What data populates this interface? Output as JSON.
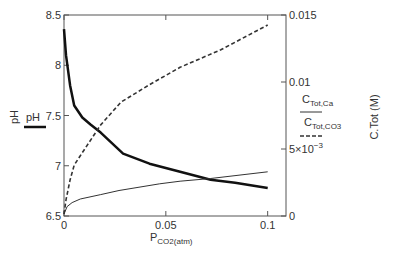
{
  "chart_data": {
    "type": "line",
    "title": "",
    "xlabel": "P",
    "xlabel_subscript": "CO2(atm)",
    "ylabel_left": "pH",
    "ylabel_right": "C.Tot (M)",
    "xlim": [
      0,
      0.109
    ],
    "ylim_left": [
      6.5,
      8.5
    ],
    "ylim_right": [
      0,
      0.015
    ],
    "grid": false,
    "x_ticks": [
      {
        "value": 0,
        "label": "0"
      },
      {
        "value": 0.05,
        "label": "0.05"
      },
      {
        "value": 0.1,
        "label": "0.1"
      }
    ],
    "y_ticks_left": [
      {
        "value": 6.5,
        "label": "6.5"
      },
      {
        "value": 7,
        "label": "7"
      },
      {
        "value": 7.5,
        "label": "7.5"
      },
      {
        "value": 8,
        "label": "8"
      },
      {
        "value": 8.5,
        "label": "8.5"
      }
    ],
    "y_ticks_right": [
      {
        "value": 0,
        "label": "0",
        "sup": ""
      },
      {
        "value": 0.005,
        "label": "5×10",
        "sup": "−3"
      },
      {
        "value": 0.01,
        "label": "0.01",
        "sup": ""
      },
      {
        "value": 0.015,
        "label": "0.015",
        "sup": ""
      }
    ],
    "series": [
      {
        "name": "pH",
        "axis": "left",
        "style": "thick-solid",
        "x": [
          0,
          0.001,
          0.003,
          0.005,
          0.009,
          0.013,
          0.018,
          0.029,
          0.042,
          0.057,
          0.072,
          0.084,
          0.1
        ],
        "y": [
          8.36,
          8.1,
          7.8,
          7.6,
          7.48,
          7.41,
          7.33,
          7.12,
          7.02,
          6.94,
          6.86,
          6.83,
          6.78
        ]
      },
      {
        "name": "C_Tot,Ca",
        "name_main": "C",
        "name_sub": "Tot,Ca",
        "axis": "right",
        "style": "thin-solid",
        "x": [
          0,
          0.0015,
          0.004,
          0.008,
          0.018,
          0.027,
          0.047,
          0.057,
          0.072,
          0.1
        ],
        "y": [
          0.00015,
          0.0007,
          0.001,
          0.00127,
          0.0016,
          0.0019,
          0.0024,
          0.0026,
          0.0028,
          0.0033
        ]
      },
      {
        "name": "C_Tot,CO3",
        "name_main": "C",
        "name_sub": "Tot,CO3",
        "axis": "right",
        "style": "dashed",
        "x": [
          0,
          0.001,
          0.003,
          0.005,
          0.008,
          0.018,
          0.028,
          0.042,
          0.057,
          0.077,
          0.1
        ],
        "y": [
          0.00015,
          0.0012,
          0.0027,
          0.0038,
          0.0045,
          0.0068,
          0.0085,
          0.0098,
          0.0111,
          0.0124,
          0.01425
        ]
      }
    ],
    "legend": {
      "left": {
        "label": "pH",
        "placement": "left"
      },
      "right": [
        {
          "main": "C",
          "sub": "Tot,Ca"
        },
        {
          "main": "C",
          "sub": "Tot,CO3"
        }
      ],
      "placement": "right"
    }
  }
}
